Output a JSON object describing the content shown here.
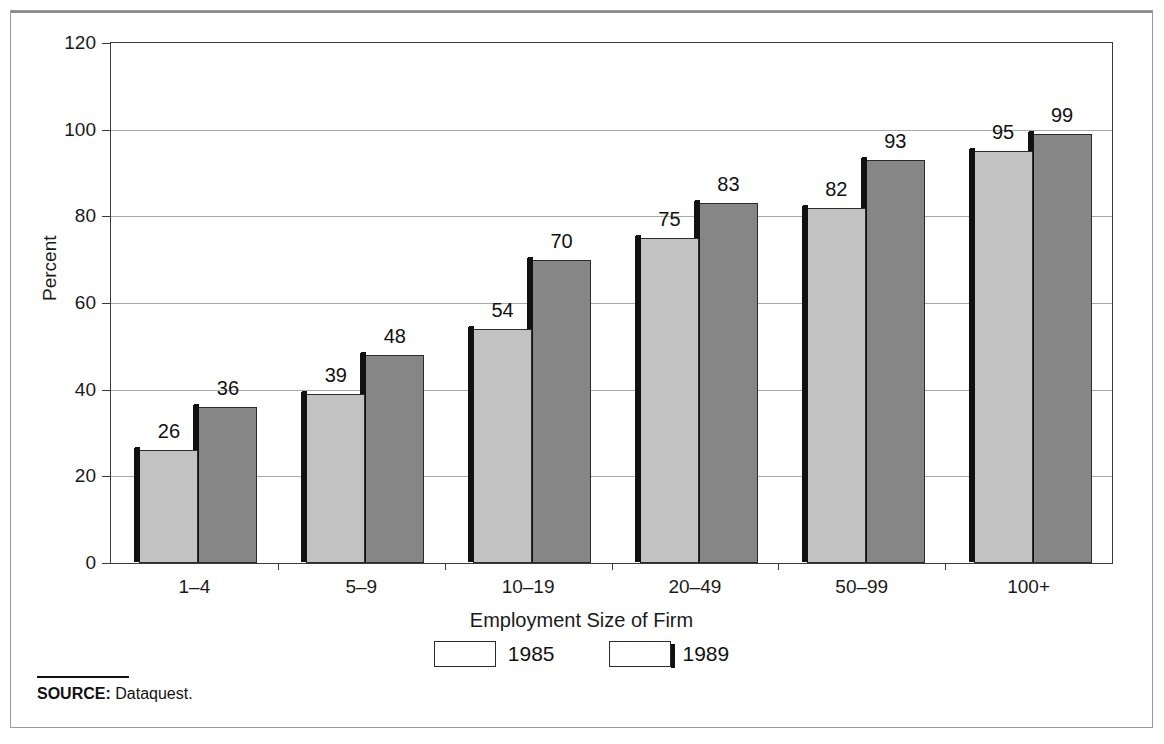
{
  "chart_data": {
    "type": "bar",
    "title": "",
    "xlabel": "Employment Size of Firm",
    "ylabel": "Percent",
    "ylim": [
      0,
      120
    ],
    "yticks": [
      0,
      20,
      40,
      60,
      80,
      100,
      120
    ],
    "ytick_labels": [
      "0",
      "20",
      "40",
      "60",
      "80",
      "100",
      "120"
    ],
    "grid": true,
    "legend_position": "bottom-center",
    "categories": [
      "1–4",
      "5–9",
      "10–19",
      "20–49",
      "50–99",
      "100+"
    ],
    "series": [
      {
        "name": "1985",
        "color": "#c2c2c2",
        "values": [
          26,
          39,
          54,
          75,
          82,
          95
        ]
      },
      {
        "name": "1989",
        "color": "#868686",
        "values": [
          36,
          48,
          70,
          83,
          93,
          99
        ]
      }
    ]
  },
  "axis": {
    "y_title": "Percent",
    "x_title": "Employment Size of Firm"
  },
  "legend": {
    "items": [
      {
        "label": "1985",
        "swatch": "light-gray-swatch"
      },
      {
        "label": "1989",
        "swatch": "dark-gray-swatch"
      }
    ]
  },
  "source": {
    "prefix": "SOURCE:",
    "text": "Dataquest."
  },
  "colors": {
    "series_1985": "#c2c2c2",
    "series_1989": "#868686",
    "bar_outline": "#2b2b2b",
    "shadow": "#111111",
    "gridline": "#a8a8a8",
    "frame": "#9b9b9b"
  }
}
